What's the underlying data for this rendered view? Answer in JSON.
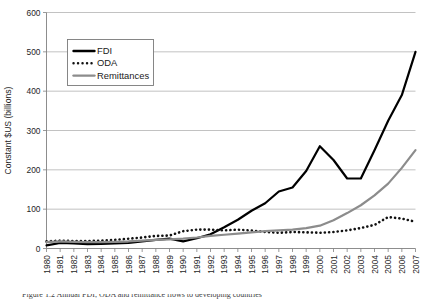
{
  "figure": {
    "background_color": "#ffffff",
    "caption_partial": "Figure 1.2  Annual FDI, ODA and remittance flows to developing countries"
  },
  "chart_data": {
    "type": "line",
    "title": "",
    "xlabel": "",
    "ylabel": "Constant $US (billions)",
    "ylim": [
      0,
      600
    ],
    "yticks": [
      0,
      100,
      200,
      300,
      400,
      500,
      600
    ],
    "ytick_labels": [
      "0",
      "100",
      "200",
      "300",
      "400",
      "500",
      "600"
    ],
    "grid": true,
    "grid_axis": "y",
    "legend_position": "upper-left-inside",
    "x": [
      "1980",
      "1981",
      "1982",
      "1983",
      "1984",
      "1985",
      "1986",
      "1987",
      "1988",
      "1989",
      "1990",
      "1991",
      "1992",
      "1993",
      "1994",
      "1995",
      "1996",
      "1997",
      "1998",
      "1999",
      "2000",
      "2001",
      "2002",
      "2003",
      "2004",
      "2005",
      "2006",
      "2007"
    ],
    "series": [
      {
        "name": "FDI",
        "style": "solid",
        "color": "#000000",
        "line_width": 2.2,
        "values": [
          8,
          14,
          13,
          11,
          12,
          13,
          14,
          18,
          22,
          25,
          18,
          26,
          36,
          54,
          73,
          96,
          115,
          145,
          155,
          197,
          260,
          225,
          178,
          178,
          250,
          325,
          390,
          500
        ]
      },
      {
        "name": "ODA",
        "style": "dotted",
        "color": "#111111",
        "line_width": 2.2,
        "values": [
          18,
          20,
          19,
          19,
          20,
          22,
          25,
          28,
          32,
          33,
          44,
          48,
          48,
          46,
          48,
          46,
          42,
          40,
          42,
          41,
          40,
          42,
          46,
          52,
          60,
          80,
          76,
          68
        ]
      },
      {
        "name": "Remittances",
        "style": "solid",
        "color": "#8c8c8c",
        "line_width": 2.2,
        "values": [
          16,
          18,
          17,
          16,
          16,
          17,
          18,
          20,
          22,
          23,
          25,
          28,
          32,
          35,
          38,
          41,
          44,
          46,
          48,
          52,
          58,
          72,
          90,
          110,
          135,
          165,
          205,
          250
        ]
      }
    ],
    "legend_entries": [
      {
        "label": "FDI",
        "style": "solid",
        "color": "#000000"
      },
      {
        "label": "ODA",
        "style": "dotted",
        "color": "#111111"
      },
      {
        "label": "Remittances",
        "style": "solid",
        "color": "#8c8c8c"
      }
    ]
  }
}
